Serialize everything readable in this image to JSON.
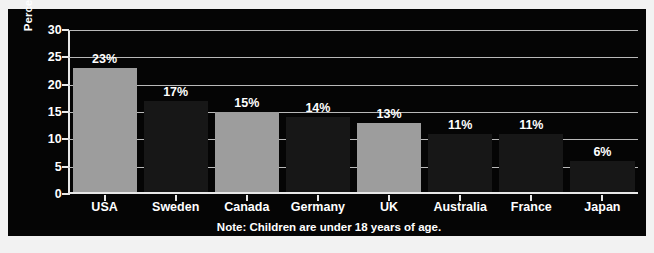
{
  "chart_data": {
    "type": "bar",
    "title": "",
    "subtitle": "",
    "xlabel": "",
    "ylabel": "Percentage of families with children",
    "ylim": [
      0,
      30
    ],
    "yticks": [
      0,
      5,
      10,
      15,
      20,
      25,
      30
    ],
    "ytick_labels": [
      "0",
      "5",
      "10",
      "15",
      "20",
      "25",
      "30"
    ],
    "grid": true,
    "legend": "none",
    "categories": [
      "USA",
      "Sweden",
      "Canada",
      "Germany",
      "UK",
      "Australia",
      "France",
      "Japan"
    ],
    "values": [
      23,
      17,
      15,
      14,
      13,
      11,
      11,
      6
    ],
    "value_labels": [
      "23%",
      "17%",
      "15%",
      "14%",
      "13%",
      "11%",
      "11%",
      "6%"
    ],
    "bar_styles": [
      "light",
      "dark",
      "light",
      "dark",
      "light",
      "dark",
      "dark",
      "dark"
    ],
    "annotations": [
      "Note: Children are under 18 years of age."
    ]
  },
  "note": {
    "text": "Note: Children are under 18 years of age."
  },
  "colors": {
    "panel_background": "#050505",
    "page_background": "#f2f2f2",
    "bar_light": "#9d9d9d",
    "bar_dark": "#171717",
    "gridline": "#b9b9b9",
    "axis": "#e8e8e8",
    "text": "#ffffff"
  }
}
